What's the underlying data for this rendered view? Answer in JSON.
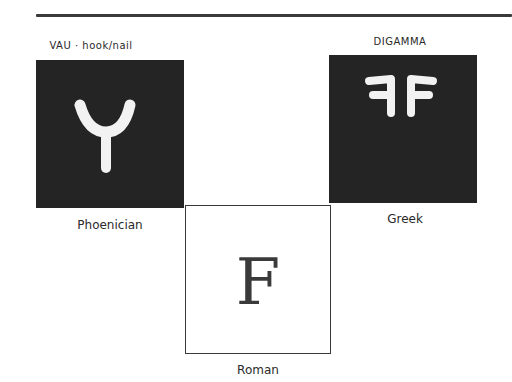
{
  "diagram": {
    "title_rule": true,
    "phoenician": {
      "header": "VAU · hook/nail",
      "caption": "Phoenician",
      "glyph": "phoenician-waw-icon"
    },
    "greek": {
      "header": "DIGAMMA",
      "caption": "Greek",
      "glyph": "greek-digamma-icon"
    },
    "roman": {
      "letter": "F",
      "caption": "Roman"
    },
    "colors": {
      "dark_box": "#242424",
      "glyph": "#f2f2f2",
      "line": "#3a3a3a"
    }
  }
}
